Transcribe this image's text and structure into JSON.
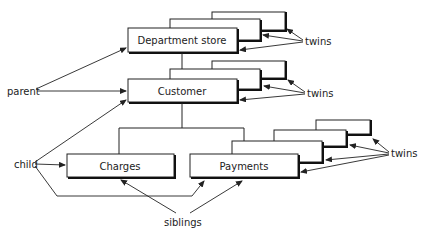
{
  "diagram": {
    "type": "hierarchical-database-structure",
    "nodes": {
      "department_store": "Department store",
      "customer": "Customer",
      "charges": "Charges",
      "payments": "Payments"
    },
    "annotations": {
      "parent": "parent",
      "child": "child",
      "siblings": "siblings",
      "twins_top": "twins",
      "twins_middle": "twins",
      "twins_bottom": "twins"
    },
    "relations": [
      {
        "from": "Department store",
        "to": "Customer",
        "type": "parent-child"
      },
      {
        "from": "Customer",
        "to": "Charges",
        "type": "parent-child"
      },
      {
        "from": "Customer",
        "to": "Payments",
        "type": "parent-child"
      },
      {
        "between": [
          "Charges",
          "Payments"
        ],
        "type": "siblings"
      }
    ],
    "twin_counts": {
      "department_store": 3,
      "customer": 3,
      "payments": 4
    }
  }
}
